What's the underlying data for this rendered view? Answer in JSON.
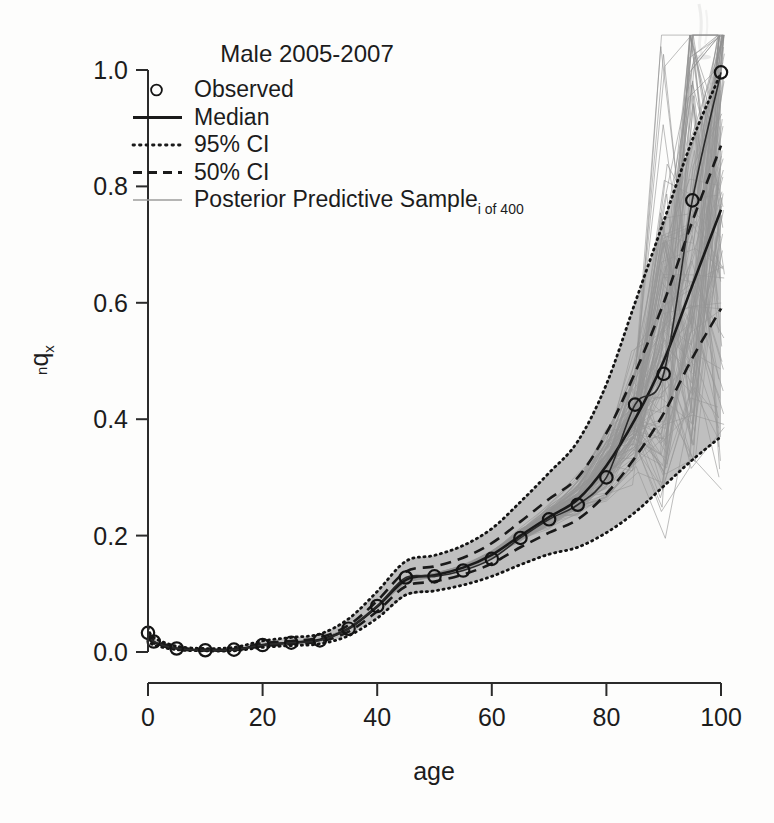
{
  "figure": {
    "title": "Male 2005-2007",
    "background_color": "#fdfdfc",
    "ink_color": "#1a1a1a",
    "sample_color": "#8d8d8d"
  },
  "axes": {
    "x": {
      "label": "age",
      "ticks": [
        "0",
        "20",
        "40",
        "60",
        "80",
        "100"
      ],
      "tick_values": [
        0,
        20,
        40,
        60,
        80,
        100
      ],
      "range": [
        0,
        100
      ]
    },
    "y": {
      "label_main": "q",
      "label_pre": "n",
      "label_post": "x",
      "ticks": [
        "0.0",
        "0.2",
        "0.4",
        "0.6",
        "0.8",
        "1.0"
      ],
      "tick_values": [
        0.0,
        0.2,
        0.4,
        0.6,
        0.8,
        1.0
      ],
      "range": [
        0.0,
        1.0
      ]
    }
  },
  "legend": {
    "position": "top-left",
    "items": [
      {
        "label": "Observed",
        "key": "circle-marker"
      },
      {
        "label": "Median",
        "key": "solid-line"
      },
      {
        "label": "95% CI",
        "key": "dotted-line"
      },
      {
        "label": "50% CI",
        "key": "dashed-line"
      },
      {
        "label": "Posterior Predictive Sample",
        "sub": "i of 400",
        "key": "thin-gray-line"
      }
    ]
  },
  "chart_data": {
    "type": "line",
    "title": "Male 2005-2007",
    "xlabel": "age",
    "ylabel": "nqx",
    "xlim": [
      0,
      100
    ],
    "ylim": [
      0.0,
      1.0
    ],
    "grid": false,
    "legend_position": "top-left",
    "n_posterior_samples": 400,
    "x": [
      0,
      1,
      5,
      10,
      15,
      20,
      25,
      30,
      35,
      40,
      45,
      50,
      55,
      60,
      65,
      70,
      75,
      80,
      85,
      90,
      95,
      100
    ],
    "series": [
      {
        "name": "Observed",
        "style": "circles",
        "values": [
          0.033,
          0.018,
          0.006,
          0.003,
          0.004,
          0.012,
          0.016,
          0.02,
          0.04,
          0.079,
          0.128,
          0.13,
          0.14,
          0.16,
          0.196,
          0.228,
          0.253,
          0.3,
          0.425,
          0.478,
          0.776,
          0.996
        ]
      },
      {
        "name": "Median",
        "style": "solid",
        "values": [
          0.03,
          0.017,
          0.006,
          0.003,
          0.004,
          0.012,
          0.016,
          0.021,
          0.04,
          0.078,
          0.124,
          0.132,
          0.145,
          0.167,
          0.2,
          0.232,
          0.262,
          0.32,
          0.4,
          0.5,
          0.63,
          0.76
        ]
      },
      {
        "name": "95% CI lower",
        "style": "dotted",
        "values": [
          0.022,
          0.012,
          0.004,
          0.002,
          0.002,
          0.008,
          0.011,
          0.014,
          0.028,
          0.058,
          0.098,
          0.105,
          0.115,
          0.13,
          0.15,
          0.168,
          0.18,
          0.205,
          0.24,
          0.285,
          0.33,
          0.37
        ]
      },
      {
        "name": "95% CI upper",
        "style": "dotted",
        "values": [
          0.042,
          0.025,
          0.01,
          0.006,
          0.008,
          0.019,
          0.025,
          0.031,
          0.057,
          0.104,
          0.156,
          0.166,
          0.183,
          0.212,
          0.258,
          0.308,
          0.362,
          0.46,
          0.6,
          0.74,
          0.88,
          0.995
        ]
      },
      {
        "name": "50% CI lower",
        "style": "dashed",
        "values": [
          0.027,
          0.015,
          0.005,
          0.0025,
          0.003,
          0.01,
          0.014,
          0.018,
          0.035,
          0.07,
          0.113,
          0.121,
          0.133,
          0.152,
          0.18,
          0.205,
          0.228,
          0.272,
          0.334,
          0.41,
          0.505,
          0.59
        ]
      },
      {
        "name": "50% CI upper",
        "style": "dashed",
        "values": [
          0.034,
          0.02,
          0.008,
          0.004,
          0.005,
          0.015,
          0.019,
          0.025,
          0.046,
          0.088,
          0.138,
          0.147,
          0.162,
          0.187,
          0.224,
          0.263,
          0.3,
          0.376,
          0.48,
          0.6,
          0.74,
          0.87
        ]
      }
    ],
    "annotations": [
      {
        "text": "infant mortality bump at age 0",
        "x": 0,
        "y": 0.033
      },
      {
        "text": "minimum around ages 5-15",
        "x": 10,
        "y": 0.003
      },
      {
        "text": "accident hump plateau ages 40-55",
        "x": 45,
        "y": 0.13
      },
      {
        "text": "exponential senescent rise after age 60",
        "x": 85,
        "y": 0.42
      },
      {
        "text": "observed reaches 1.0 at age 100",
        "x": 100,
        "y": 0.996
      }
    ]
  }
}
